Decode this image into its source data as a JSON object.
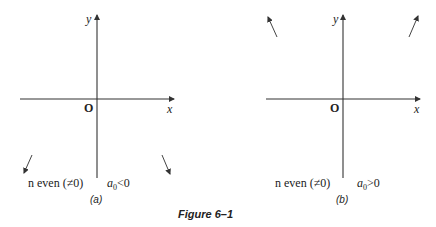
{
  "figure": {
    "caption": "Figure 6–1",
    "panels": [
      {
        "id": "a",
        "label": "(a)",
        "x_axis_label": "x",
        "y_axis_label": "y",
        "origin_label": "O",
        "condition_n": "n even (≠0)",
        "condition_a0_symbol": "a",
        "condition_a0_sub": "0",
        "condition_a0_rel": "<0",
        "arrows": [
          "down-left",
          "down-right"
        ]
      },
      {
        "id": "b",
        "label": "(b)",
        "x_axis_label": "x",
        "y_axis_label": "y",
        "origin_label": "O",
        "condition_n": "n even (≠0)",
        "condition_a0_symbol": "a",
        "condition_a0_sub": "0",
        "condition_a0_rel": ">0",
        "arrows": [
          "up-left",
          "up-right"
        ]
      }
    ]
  }
}
